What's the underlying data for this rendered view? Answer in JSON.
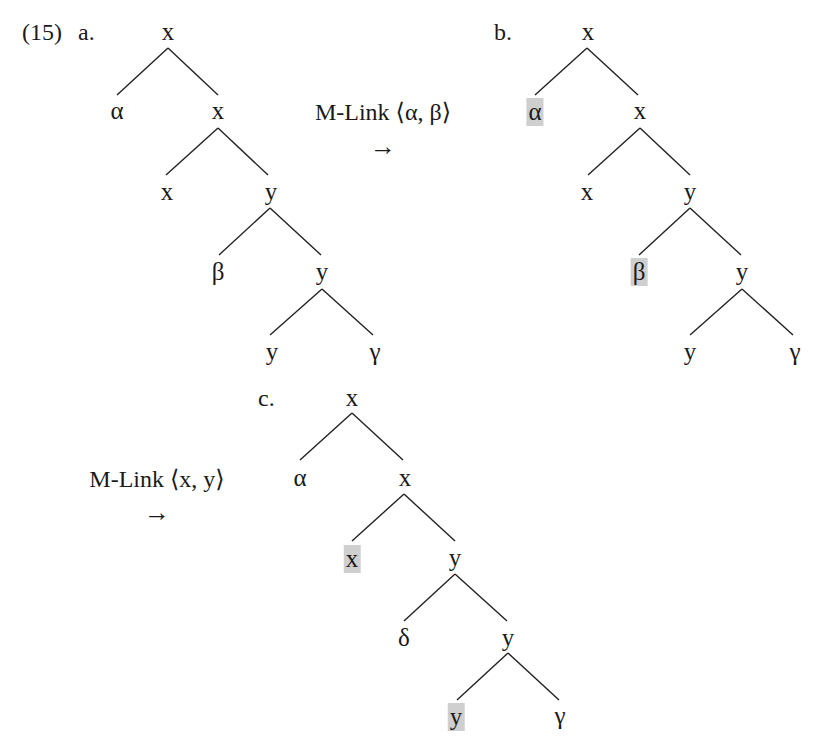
{
  "example": {
    "number": "(15)",
    "highlight_color": "#cfcfcf",
    "text_color": "#1a1a1a"
  },
  "trees": {
    "a": {
      "label": "a.",
      "nodes": {
        "root": "x",
        "n1": "α",
        "n2": "x",
        "n3": "x",
        "n4": "y",
        "n5": "β",
        "n6": "y",
        "n7": "y",
        "n8": "γ"
      }
    },
    "b": {
      "label": "b.",
      "nodes": {
        "root": "x",
        "n1": "α",
        "n2": "x",
        "n3": "x",
        "n4": "y",
        "n5": "β",
        "n6": "y",
        "n7": "y",
        "n8": "γ"
      },
      "highlighted": [
        "n1",
        "n5"
      ]
    },
    "c": {
      "label": "c.",
      "nodes": {
        "root": "x",
        "n1": "α",
        "n2": "x",
        "n3": "x",
        "n4": "y",
        "n5": "δ",
        "n6": "y",
        "n7": "y",
        "n8": "γ"
      },
      "highlighted": [
        "n3",
        "n7"
      ]
    }
  },
  "operations": [
    {
      "label": "M-Link ⟨α, β⟩",
      "arrow": "→"
    },
    {
      "label": "M-Link ⟨x, y⟩",
      "arrow": "→"
    }
  ]
}
